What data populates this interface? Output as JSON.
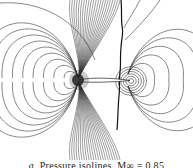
{
  "figure": {
    "type": "pressure-isoline contour plot",
    "features": [
      "leading-edge stagnation region",
      "upper-surface shock",
      "trailing-edge vortex-like closed isolines"
    ],
    "colors": {
      "background": "#ffffff",
      "lines": "#3a3a3a",
      "shock": "#111111"
    }
  },
  "caption": {
    "label": "a.",
    "text": "Pressure isolines,",
    "param": "M∞ = 0.85"
  }
}
